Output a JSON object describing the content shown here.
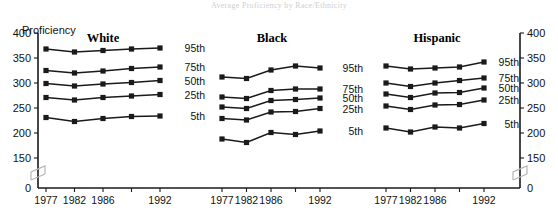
{
  "figure": {
    "faint_cropped_title": "Average Proficiency by Race/Ethnicity",
    "y_axis_title": "Proficiency"
  },
  "chart_data": {
    "type": "line",
    "title": "Average Proficiency by Race/Ethnicity",
    "xlabel": "",
    "ylabel": "Proficiency",
    "ylim": [
      150,
      400
    ],
    "y_ticks": [
      0,
      150,
      200,
      250,
      300,
      350,
      400
    ],
    "y_axis_break": true,
    "grid": false,
    "legend": "inline-right-of-each-panel",
    "dual_y_axis": true,
    "x": [
      1977,
      1982,
      1986,
      1990,
      1992
    ],
    "x_tick_labels": [
      "1977",
      "1982",
      "1986",
      "",
      "1992"
    ],
    "panels": [
      {
        "name": "White",
        "series": [
          {
            "name": "95th",
            "values": [
              368,
              362,
              365,
              368,
              370
            ]
          },
          {
            "name": "75th",
            "values": [
              325,
              320,
              324,
              329,
              332
            ]
          },
          {
            "name": "50th",
            "values": [
              299,
              294,
              298,
              301,
              305
            ]
          },
          {
            "name": "25th",
            "values": [
              271,
              266,
              271,
              274,
              277
            ]
          },
          {
            "name": "5th",
            "values": [
              231,
              223,
              229,
              233,
              234
            ]
          }
        ]
      },
      {
        "name": "Black",
        "series": [
          {
            "name": "95th",
            "values": [
              312,
              309,
              326,
              334,
              330
            ]
          },
          {
            "name": "75th",
            "values": [
              272,
              269,
              285,
              288,
              288
            ]
          },
          {
            "name": "50th",
            "values": [
              252,
              249,
              265,
              267,
              270
            ]
          },
          {
            "name": "25th",
            "values": [
              229,
              226,
              242,
              243,
              249
            ]
          },
          {
            "name": "5th",
            "values": [
              188,
              181,
              201,
              197,
              204
            ]
          }
        ]
      },
      {
        "name": "Hispanic",
        "series": [
          {
            "name": "95th",
            "values": [
              334,
              328,
              330,
              332,
              342
            ]
          },
          {
            "name": "75th",
            "values": [
              300,
              293,
              300,
              305,
              310
            ]
          },
          {
            "name": "50th",
            "values": [
              278,
              271,
              280,
              281,
              290
            ]
          },
          {
            "name": "25th",
            "values": [
              254,
              247,
              256,
              257,
              266
            ]
          },
          {
            "name": "5th",
            "values": [
              210,
              202,
              212,
              210,
              219
            ]
          }
        ]
      }
    ]
  },
  "labels": {
    "series_names": [
      "95th",
      "75th",
      "50th",
      "25th",
      "5th"
    ],
    "panel_names": [
      "White",
      "Black",
      "Hispanic"
    ],
    "y_tick_labels": [
      "400",
      "350",
      "300",
      "250",
      "200",
      "150",
      "0"
    ],
    "x_tick_labels": [
      "1977",
      "1982",
      "1986",
      "1992"
    ]
  }
}
